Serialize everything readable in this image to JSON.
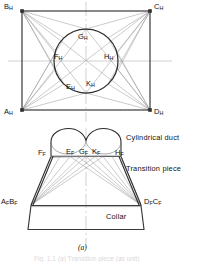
{
  "figure": {
    "title_caption": "(a)",
    "footer_caption": "Fig. 1.1 (a) Transition piece (as unit)",
    "annotations": [
      {
        "name": "cylindrical-duct",
        "text": "Cylindrical duct"
      },
      {
        "name": "transition-piece",
        "text": "Transition piece"
      },
      {
        "name": "collar",
        "text": "Collar"
      }
    ],
    "plan_view": {
      "name": "plan-view",
      "rect_corners": [
        {
          "id": "B_H",
          "base": "B",
          "sub": "H",
          "x": 22,
          "y": 11
        },
        {
          "id": "C_H",
          "base": "C",
          "sub": "H",
          "x": 150,
          "y": 11
        },
        {
          "id": "D_H",
          "base": "D",
          "sub": "H",
          "x": 150,
          "y": 110
        },
        {
          "id": "A_H",
          "base": "A",
          "sub": "H",
          "x": 22,
          "y": 110
        }
      ],
      "circle": {
        "cx": 86,
        "cy": 61,
        "r": 32
      },
      "circle_points": [
        {
          "id": "G_H",
          "base": "G",
          "sub": "H"
        },
        {
          "id": "H_H",
          "base": "H",
          "sub": "H"
        },
        {
          "id": "K_H",
          "base": "K",
          "sub": "H"
        },
        {
          "id": "E_H",
          "base": "E",
          "sub": "H"
        },
        {
          "id": "F_H",
          "base": "F",
          "sub": "H"
        }
      ]
    },
    "front_view": {
      "name": "front-view",
      "duct_points": [
        {
          "id": "F_F",
          "base": "F",
          "sub": "F"
        },
        {
          "id": "E_F",
          "base": "E",
          "sub": "F"
        },
        {
          "id": "G_F",
          "base": "G",
          "sub": "F"
        },
        {
          "id": "K_F",
          "base": "K",
          "sub": "F"
        },
        {
          "id": "H_F",
          "base": "H",
          "sub": "F"
        }
      ],
      "collar_points": [
        {
          "id": "A_F B_F",
          "base1": "A",
          "sub1": "F",
          "base2": "B",
          "sub2": "F"
        },
        {
          "id": "D_F C_F",
          "base1": "D",
          "sub1": "F",
          "base2": "C",
          "sub2": "F"
        }
      ]
    },
    "colors": {
      "line": "#3a3a3a",
      "thin_line": "#8c8c8c",
      "centerline": "#b4b4b4",
      "text": "#111111"
    }
  }
}
